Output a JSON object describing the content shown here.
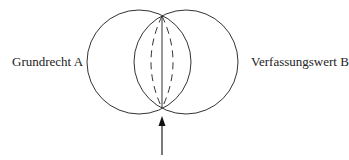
{
  "diagram": {
    "left_label": "Grundrecht A",
    "right_label": "Verfassungswert B",
    "colors": {
      "stroke": "#333333",
      "text": "#222222",
      "background": "#ffffff"
    },
    "circles": [
      {
        "name": "Grundrecht A",
        "cx": 139,
        "cy": 62,
        "r": 52
      },
      {
        "name": "Verfassungswert B",
        "cx": 186,
        "cy": 62,
        "r": 52
      }
    ],
    "arrow": {
      "direction": "up",
      "x": 162,
      "from_y": 155,
      "to_y": 117
    }
  }
}
